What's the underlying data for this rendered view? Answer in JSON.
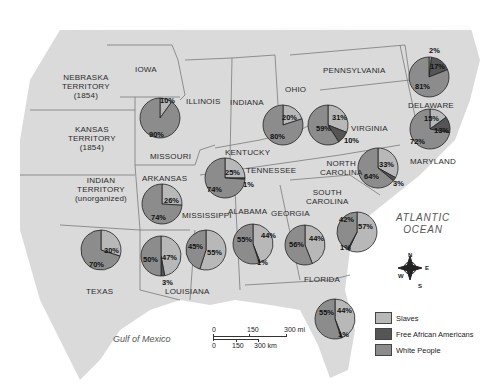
{
  "colors": {
    "slaves": "#b8b8b8",
    "free_african_americans": "#555555",
    "white_people": "#8c8c8c",
    "land": "#dcdcdc",
    "border": "#777777"
  },
  "state_labels": {
    "nebraska": "NEBRASKA",
    "nebraska_l2": "TERRITORY",
    "nebraska_l3": "(1854)",
    "kansas": "KANSAS",
    "kansas_l2": "TERRITORY",
    "kansas_l3": "(1854)",
    "indian": "INDIAN",
    "indian_l2": "TERRITORY",
    "indian_l3": "(unorganized)",
    "iowa": "IOWA",
    "illinois": "ILLINOIS",
    "indiana": "INDIANA",
    "ohio": "OHIO",
    "pennsylvania": "PENNSYLVANIA",
    "missouri": "MISSOURI",
    "kentucky": "KENTUCKY",
    "tennessee": "TENNESSEE",
    "arkansas": "ARKANSAS",
    "mississippi": "MISSISSIPPI",
    "alabama": "ALABAMA",
    "georgia": "GEORGIA",
    "north_carolina": "NORTH",
    "north_carolina_l2": "CAROLINA",
    "south_carolina": "SOUTH",
    "south_carolina_l2": "CAROLINA",
    "virginia": "VIRGINIA",
    "delaware": "DELAWARE",
    "maryland": "MARYLAND",
    "texas": "TEXAS",
    "louisiana": "LOUISIANA",
    "florida": "FLORIDA"
  },
  "water_labels": {
    "atlantic_l1": "ATLANTIC",
    "atlantic_l2": "OCEAN",
    "gulf": "Gulf of Mexico"
  },
  "compass": {
    "n": "N",
    "e": "E",
    "s": "S",
    "w": "W"
  },
  "scale_bar": {
    "mi_0": "0",
    "mi_150": "150",
    "mi_300": "300 mi",
    "km_0": "0",
    "km_150": "150",
    "km_300": "300 km"
  },
  "legend": {
    "items": [
      {
        "label": "Slaves"
      },
      {
        "label": "Free African Americans"
      },
      {
        "label": "White People"
      }
    ]
  },
  "chart_data": {
    "type": "pie",
    "title": "",
    "legend": [
      "Slaves",
      "Free African Americans",
      "White People"
    ],
    "legend_position": "bottom-right",
    "pies": [
      {
        "state": "Missouri",
        "slaves": 10,
        "free_african_americans": 0,
        "white_people": 90
      },
      {
        "state": "Kentucky/Tennessee",
        "slaves": 25,
        "free_african_americans": 1,
        "white_people": 74
      },
      {
        "state": "Ohio",
        "slaves": 20,
        "free_african_americans": 0,
        "white_people": 80
      },
      {
        "state": "Virginia",
        "slaves": 31,
        "free_african_americans": 10,
        "white_people": 59
      },
      {
        "state": "Delaware",
        "slaves": 2,
        "free_african_americans": 17,
        "white_people": 81
      },
      {
        "state": "Maryland",
        "slaves": 15,
        "free_african_americans": 13,
        "white_people": 72
      },
      {
        "state": "North Carolina",
        "slaves": 33,
        "free_african_americans": 3,
        "white_people": 64
      },
      {
        "state": "Arkansas",
        "slaves": 26,
        "free_african_americans": 0,
        "white_people": 74
      },
      {
        "state": "Texas",
        "slaves": 30,
        "free_african_americans": 0,
        "white_people": 70
      },
      {
        "state": "Louisiana",
        "slaves": 47,
        "free_african_americans": 3,
        "white_people": 50
      },
      {
        "state": "Mississippi",
        "slaves": 55,
        "free_african_americans": 0,
        "white_people": 45
      },
      {
        "state": "Alabama",
        "slaves": 44,
        "free_african_americans": 1,
        "white_people": 55
      },
      {
        "state": "Georgia",
        "slaves": 44,
        "free_african_americans": 0,
        "white_people": 56
      },
      {
        "state": "South Carolina",
        "slaves": 57,
        "free_african_americans": 1,
        "white_people": 42
      },
      {
        "state": "Florida",
        "slaves": 44,
        "free_african_americans": 1,
        "white_people": 55
      }
    ]
  },
  "pie_labels": {
    "missouri_s": "10%",
    "missouri_w": "90%",
    "tn_s": "25%",
    "tn_f": "1%",
    "tn_w": "74%",
    "ohio_s": "20%",
    "ohio_w": "80%",
    "va_s": "31%",
    "va_f": "10%",
    "va_w": "59%",
    "de_s": "2%",
    "de_f": "17%",
    "de_w": "81%",
    "md_s": "15%",
    "md_f": "13%",
    "md_w": "72%",
    "nc_s": "33%",
    "nc_f": "3%",
    "nc_w": "64%",
    "ar_s": "26%",
    "ar_w": "74%",
    "tx_s": "30%",
    "tx_w": "70%",
    "la_s": "47%",
    "la_f": "3%",
    "la_w": "50%",
    "ms_s": "55%",
    "ms_w": "45%",
    "al_s": "44%",
    "al_f": "1%",
    "al_w": "55%",
    "ga_s": "44%",
    "ga_w": "56%",
    "sc_s": "57%",
    "sc_f": "1%",
    "sc_w": "42%",
    "fl_s": "44%",
    "fl_f": "1%",
    "fl_w": "55%"
  }
}
